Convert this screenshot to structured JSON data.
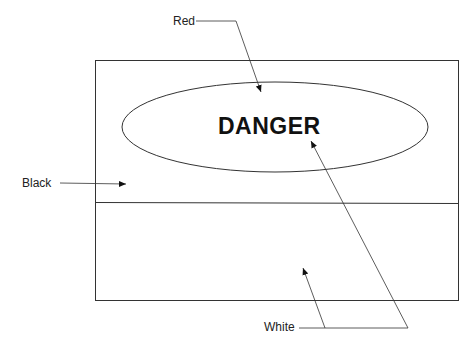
{
  "diagram": {
    "sign_text": "DANGER",
    "labels": {
      "red": "Red",
      "black": "Black",
      "white": "White"
    },
    "regions": [
      {
        "name": "upper-panel",
        "color_label": "Black"
      },
      {
        "name": "oval",
        "color_label": "Red"
      },
      {
        "name": "lower-panel",
        "color_label": "White"
      },
      {
        "name": "text",
        "color_label": "White"
      }
    ]
  }
}
